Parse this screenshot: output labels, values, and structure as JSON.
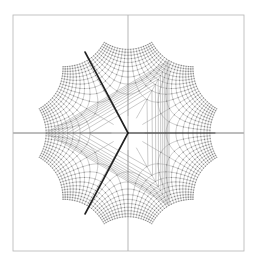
{
  "figure": {
    "title": "",
    "background_color": "#ffffff",
    "width": 257,
    "height": 264
  },
  "frame": {
    "name": "plot-frame",
    "x": 13,
    "y": 15,
    "width": 231,
    "height": 236,
    "stroke_color": "#b4b4b4",
    "stroke_width": 0.8,
    "fill": "none"
  },
  "chart_data": {
    "type": "line",
    "subtype": "conformal-grid",
    "title": "",
    "subtitle": "",
    "xlabel": "",
    "ylabel": "",
    "grid": true,
    "legend": null,
    "legend_position": "none",
    "axis_ranges": {
      "xlim": [
        -1.65,
        1.65
      ],
      "ylim": [
        -1.65,
        1.65
      ]
    },
    "center_point": {
      "label": "origin",
      "px": [
        128,
        133
      ],
      "data": [
        0,
        0
      ]
    },
    "branch_points": [
      {
        "label": "branch-point-right",
        "px": [
          215,
          133
        ],
        "data": [
          1.0,
          0.0
        ],
        "angle_deg": 0
      },
      {
        "label": "branch-point-upper-left",
        "px": [
          85,
          52
        ],
        "data": [
          -0.5,
          0.866
        ],
        "angle_deg": 120
      },
      {
        "label": "branch-point-lower-left",
        "px": [
          85,
          214
        ],
        "data": [
          -0.5,
          -0.866
        ],
        "angle_deg": 240
      }
    ],
    "branch_cuts": [
      {
        "label": "cut-to-right",
        "from": [
          128,
          133
        ],
        "to": [
          215,
          133
        ],
        "stroke_color": "#4a4a4a",
        "stroke_width": 1.0
      },
      {
        "label": "cut-to-upper-left",
        "from": [
          128,
          133
        ],
        "to": [
          85,
          52
        ],
        "stroke_color": "#222222",
        "stroke_width": 1.6
      },
      {
        "label": "cut-to-lower-left",
        "from": [
          128,
          133
        ],
        "to": [
          85,
          214
        ],
        "stroke_color": "#222222",
        "stroke_width": 1.6
      }
    ],
    "axis_lines": [
      {
        "label": "real-axis",
        "from": [
          13,
          133
        ],
        "to": [
          244,
          133
        ],
        "stroke_color": "#6b6b6b",
        "stroke_width": 0.9
      },
      {
        "label": "imaginary-axis",
        "from": [
          128,
          15
        ],
        "to": [
          128,
          251
        ],
        "stroke_color": "#9a9a9a",
        "stroke_width": 0.7
      }
    ],
    "grid_style": {
      "stroke_color": "#a0a0a0",
      "stroke_width": 0.55,
      "node_color": "#7d7d7d",
      "node_radius": 0.55,
      "u_lines": 21,
      "v_lines": 21,
      "u_range": [
        -1.6,
        1.6
      ],
      "v_range": [
        -1.6,
        1.6
      ],
      "samples_per_line": 240,
      "map_exponent": 3,
      "map_scale": 1.0
    }
  }
}
